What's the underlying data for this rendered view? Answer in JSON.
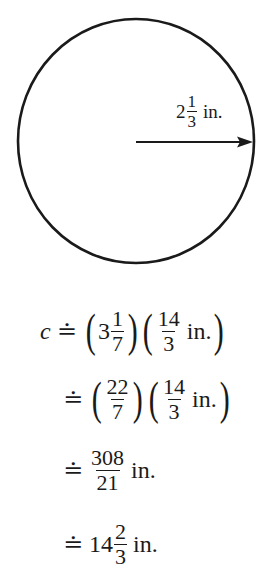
{
  "figure": {
    "shape": "circle",
    "radius_label": {
      "whole": "2",
      "numerator": "1",
      "denominator": "3",
      "unit": "in."
    },
    "stroke_color": "#1a1a1a"
  },
  "equations": [
    {
      "lhs_var": "c",
      "relation": "≐",
      "factor1": {
        "whole": "3",
        "numerator": "1",
        "denominator": "7"
      },
      "factor2": {
        "numerator": "14",
        "denominator": "3",
        "unit": "in."
      }
    },
    {
      "relation": "≐",
      "factor1": {
        "numerator": "22",
        "denominator": "7"
      },
      "factor2": {
        "numerator": "14",
        "denominator": "3",
        "unit": "in."
      }
    },
    {
      "relation": "≐",
      "result": {
        "numerator": "308",
        "denominator": "21",
        "unit": "in."
      }
    },
    {
      "relation": "≐",
      "result": {
        "whole": "14",
        "numerator": "2",
        "denominator": "3",
        "unit": "in."
      }
    }
  ]
}
